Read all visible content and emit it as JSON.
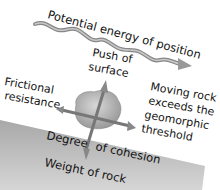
{
  "diagram": {
    "labels": {
      "potential_energy": "Potential energy of position",
      "push_line1": "Push of",
      "push_line2": "surface",
      "friction_line1": "Frictional",
      "friction_line2": "resistance",
      "moving_line1": "Moving rock",
      "moving_line2": "exceeds the",
      "moving_line3": "geomorphic",
      "moving_line4": "threshold",
      "cohesion_part1": "Degree",
      "cohesion_part2": "of cohesion",
      "weight": "Weight of rock"
    },
    "colors": {
      "slope": "#b4b4b4",
      "rock": "#c8c8c8",
      "arrow": "#8a8a8a",
      "text": "#111111"
    }
  }
}
